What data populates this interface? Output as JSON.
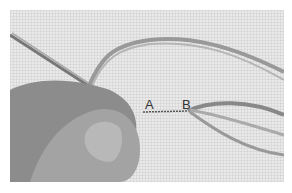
{
  "image": {
    "description": "Black-and-white photo of fingers holding embroidery floss on linen fabric, with a short stitched line between two points",
    "labels": [
      {
        "text": "A",
        "x": 145,
        "y": 98
      },
      {
        "text": "B",
        "x": 182,
        "y": 98
      }
    ],
    "colors": {
      "fabric": "#e9e9e9",
      "skin": "#8a8a8a",
      "thread": "#9a9a9a"
    }
  }
}
